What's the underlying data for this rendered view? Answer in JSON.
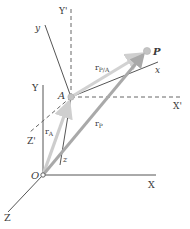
{
  "diagram": {
    "points": {
      "O": {
        "label": "O",
        "x": 43,
        "y": 175
      },
      "A": {
        "label": "A",
        "x": 71,
        "y": 97
      },
      "P": {
        "label": "P",
        "x": 147,
        "y": 51
      }
    },
    "fixed_axes": {
      "X": {
        "label": "X"
      },
      "Y": {
        "label": "Y"
      },
      "Z": {
        "label": "Z"
      }
    },
    "translating_axes": {
      "X'": {
        "label": "X'"
      },
      "Y'": {
        "label": "Y'"
      },
      "Z'": {
        "label": "Z'"
      }
    },
    "moving_axes": {
      "x": {
        "label": "x"
      },
      "y": {
        "label": "y"
      },
      "z": {
        "label": "z"
      }
    },
    "vectors": {
      "rA": {
        "base": "r",
        "sub": "A",
        "color": "#c8c8c8"
      },
      "rP": {
        "base": "r",
        "sub": "P",
        "color": "#a9a9a9"
      },
      "rPA": {
        "base": "r",
        "sub": "P/A",
        "color": "#cfcfcf"
      }
    },
    "colors": {
      "axis": "#555555",
      "dashed": "#666666",
      "point": "#bdbdbd"
    }
  }
}
